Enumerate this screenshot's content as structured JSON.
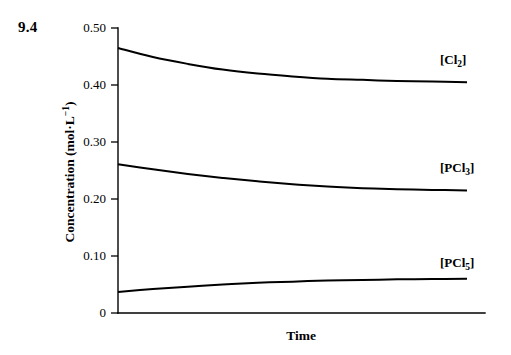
{
  "figure": {
    "number": "9.4"
  },
  "chart_data": {
    "type": "line",
    "title": "",
    "xlabel": "Time",
    "ylabel": "Concentration (mol·L⁻¹)",
    "ylabel_main": "Concentration (mol·L",
    "ylabel_exponent": "−1",
    "ylabel_close": ")",
    "x": [
      0,
      0.1,
      0.2,
      0.3,
      0.4,
      0.5,
      0.6,
      0.7,
      0.8,
      0.9,
      1.0
    ],
    "xlim": [
      0,
      1
    ],
    "ylim": [
      0,
      0.5
    ],
    "grid": false,
    "legend_position": "right-inline",
    "yticks": [
      0,
      0.1,
      0.2,
      0.3,
      0.4,
      0.5
    ],
    "ytick_labels": [
      "0",
      "0.10",
      "0.20",
      "0.30",
      "0.40",
      "0.50"
    ],
    "xticks": [],
    "xtick_labels": [],
    "series": [
      {
        "name": "[Cl2]",
        "label_main": "[Cl",
        "label_sub": "2",
        "label_close": "]",
        "values": [
          0.465,
          0.449,
          0.437,
          0.427,
          0.42,
          0.415,
          0.411,
          0.409,
          0.407,
          0.406,
          0.405
        ],
        "start_value": 0.465,
        "end_value": 0.405,
        "color": "#000000"
      },
      {
        "name": "[PCl3]",
        "label_main": "[PCl",
        "label_sub": "3",
        "label_close": "]",
        "values": [
          0.261,
          0.252,
          0.244,
          0.237,
          0.231,
          0.226,
          0.222,
          0.219,
          0.217,
          0.216,
          0.215
        ],
        "start_value": 0.261,
        "end_value": 0.215,
        "color": "#000000"
      },
      {
        "name": "[PCl5]",
        "label_main": "[PCl",
        "label_sub": "5",
        "label_close": "]",
        "values": [
          0.037,
          0.042,
          0.046,
          0.05,
          0.053,
          0.055,
          0.057,
          0.058,
          0.059,
          0.0595,
          0.06
        ],
        "start_value": 0.037,
        "end_value": 0.06,
        "color": "#000000"
      }
    ]
  }
}
